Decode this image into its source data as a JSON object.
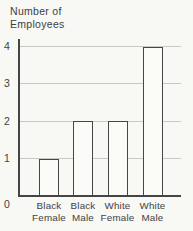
{
  "title": {
    "line1": "Number of",
    "line2": "Employees"
  },
  "chart_data": {
    "type": "bar",
    "title": "Number of Employees",
    "ylabel": "Number of Employees",
    "xlabel": "",
    "categories": [
      "Black Female",
      "Black Male",
      "White Female",
      "White Male"
    ],
    "values": [
      1,
      2,
      2,
      4
    ],
    "ylim": [
      0,
      4
    ],
    "yticks": [
      0,
      1,
      2,
      3,
      4
    ],
    "grid": true,
    "legend": "none",
    "colors": {
      "background": "#f8f8f5",
      "bar_fill": "#fbfbf8",
      "bar_border": "#464646",
      "gridline": "#c9c9c4",
      "axis": "#454545",
      "text": "#424242"
    }
  }
}
